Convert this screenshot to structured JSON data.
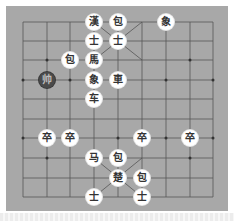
{
  "board": {
    "columns": [
      23,
      47,
      70,
      94,
      118,
      142,
      166,
      190,
      213
    ],
    "rows": [
      22,
      41,
      60,
      80,
      99,
      119,
      138,
      158,
      178,
      197
    ],
    "background": "#a8a8a8",
    "line_color": "#555555"
  },
  "pieces": [
    {
      "id": "p0",
      "label": "漢",
      "col": 3,
      "row": 0,
      "side": "black",
      "type": "general"
    },
    {
      "id": "p1",
      "label": "包",
      "col": 4,
      "row": 0,
      "side": "black",
      "type": "cannon"
    },
    {
      "id": "p2",
      "label": "象",
      "col": 6,
      "row": 0,
      "side": "black",
      "type": "elephant"
    },
    {
      "id": "p3",
      "label": "士",
      "col": 3,
      "row": 1,
      "side": "black",
      "type": "advisor"
    },
    {
      "id": "p4",
      "label": "士",
      "col": 4,
      "row": 1,
      "side": "black",
      "type": "advisor"
    },
    {
      "id": "p5",
      "label": "包",
      "col": 2,
      "row": 2,
      "side": "black",
      "type": "cannon"
    },
    {
      "id": "p6",
      "label": "馬",
      "col": 3,
      "row": 2,
      "side": "black",
      "type": "horse"
    },
    {
      "id": "p7",
      "label": "帅",
      "col": 1,
      "row": 3,
      "side": "dark",
      "type": "marker"
    },
    {
      "id": "p8",
      "label": "象",
      "col": 3,
      "row": 3,
      "side": "black",
      "type": "elephant"
    },
    {
      "id": "p9",
      "label": "車",
      "col": 4,
      "row": 3,
      "side": "black",
      "type": "chariot"
    },
    {
      "id": "p10",
      "label": "车",
      "col": 3,
      "row": 4,
      "side": "red",
      "type": "chariot"
    },
    {
      "id": "p11",
      "label": "卒",
      "col": 1,
      "row": 6,
      "side": "red",
      "type": "soldier"
    },
    {
      "id": "p12",
      "label": "卒",
      "col": 2,
      "row": 6,
      "side": "red",
      "type": "soldier"
    },
    {
      "id": "p13",
      "label": "卒",
      "col": 5,
      "row": 6,
      "side": "red",
      "type": "soldier"
    },
    {
      "id": "p14",
      "label": "卒",
      "col": 7,
      "row": 6,
      "side": "red",
      "type": "soldier"
    },
    {
      "id": "p15",
      "label": "马",
      "col": 3,
      "row": 7,
      "side": "red",
      "type": "horse"
    },
    {
      "id": "p16",
      "label": "包",
      "col": 4,
      "row": 7,
      "side": "red",
      "type": "cannon"
    },
    {
      "id": "p17",
      "label": "楚",
      "col": 4,
      "row": 8,
      "side": "red",
      "type": "general"
    },
    {
      "id": "p18",
      "label": "包",
      "col": 5,
      "row": 8,
      "side": "red",
      "type": "cannon"
    },
    {
      "id": "p19",
      "label": "士",
      "col": 3,
      "row": 9,
      "side": "red",
      "type": "advisor"
    },
    {
      "id": "p20",
      "label": "士",
      "col": 5,
      "row": 9,
      "side": "red",
      "type": "advisor"
    }
  ]
}
